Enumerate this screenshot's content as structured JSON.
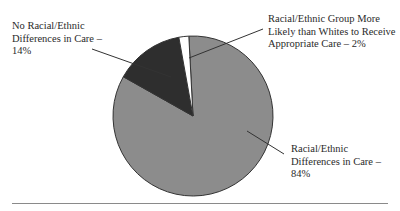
{
  "chart_data": {
    "type": "pie",
    "title": "",
    "slices": [
      {
        "label": "Racial/Ethnic Differences in Care – 84%",
        "value": 84,
        "color": "#8c8c8c"
      },
      {
        "label": "No Racial/Ethnic Differences in Care – 14%",
        "value": 14,
        "color": "#2e2e2e"
      },
      {
        "label": "Racial/Ethnic Group More Likely than Whites to Receive Appropriate Care – 2%",
        "value": 2,
        "color": "#ffffff"
      }
    ],
    "start_angle_deg": -3,
    "legend": "none (leader-line labels)"
  },
  "labels": {
    "no_diff": "No Racial/Ethnic Differences in Care – 14%",
    "more_likely": "Racial/Ethnic Group More Likely than Whites to Receive Appropriate Care – 2%",
    "differences": "Racial/Ethnic Differences in Care – 84%"
  }
}
